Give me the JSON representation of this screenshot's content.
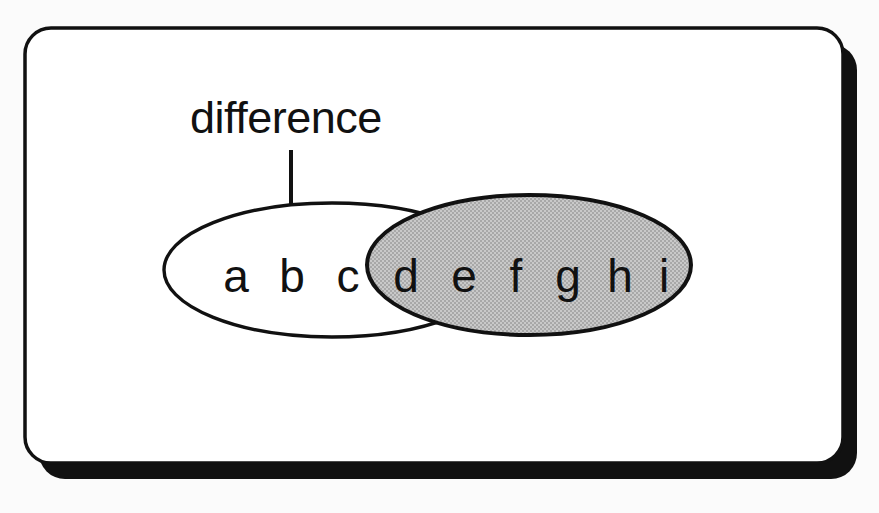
{
  "canvas": {
    "width": 879,
    "height": 513,
    "background_color": "#fbfbfb"
  },
  "card": {
    "name": "slide-card",
    "fill_color": "#ffffff",
    "border_color": "#111111",
    "shadow_color": "#111111",
    "x": 25,
    "y": 28,
    "width": 818,
    "height": 435,
    "corner_radius": 26,
    "border_width": 3.5,
    "shadow_offset_x": 14,
    "shadow_offset_y": 16
  },
  "annotation": {
    "label": "difference",
    "label_x": 190,
    "label_baseline_y": 133,
    "font_size": 45,
    "arrow": {
      "name": "difference-arrow",
      "x": 291,
      "y_start": 150,
      "y_tip": 240,
      "stroke_width": 4,
      "head_width": 26,
      "head_height": 30,
      "color": "#111111"
    }
  },
  "diagram": {
    "type": "venn-two-set-difference",
    "left_set": {
      "name": "set-a-ellipse",
      "fill_color": "#ffffff",
      "stroke_color": "#111111",
      "stroke_width": 3.4,
      "cx": 332,
      "cy": 270,
      "rx": 168,
      "ry": 67,
      "members": [
        "a",
        "b",
        "c"
      ]
    },
    "right_set": {
      "name": "set-b-ellipse",
      "fill_color": "#bdbdbd",
      "stroke_color": "#111111",
      "stroke_width": 4,
      "cx": 529,
      "cy": 265,
      "rx": 162,
      "ry": 70,
      "members": [
        "d",
        "e",
        "f",
        "g",
        "h",
        "i"
      ]
    },
    "elements": [
      {
        "label": "a",
        "x": 236,
        "y": 292,
        "region": "left-only"
      },
      {
        "label": "b",
        "x": 292,
        "y": 292,
        "region": "left-only"
      },
      {
        "label": "c",
        "x": 348,
        "y": 292,
        "region": "left-only"
      },
      {
        "label": "d",
        "x": 406,
        "y": 292,
        "region": "right"
      },
      {
        "label": "e",
        "x": 464,
        "y": 292,
        "region": "right"
      },
      {
        "label": "f",
        "x": 516,
        "y": 292,
        "region": "right"
      },
      {
        "label": "g",
        "x": 568,
        "y": 292,
        "region": "right"
      },
      {
        "label": "h",
        "x": 620,
        "y": 292,
        "region": "right"
      },
      {
        "label": "i",
        "x": 664,
        "y": 292,
        "region": "right"
      }
    ]
  }
}
